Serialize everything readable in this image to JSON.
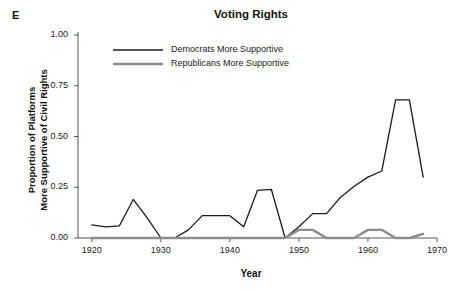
{
  "panel_label": "E",
  "axes": {
    "ylabel_line1": "Proportion of Platforms",
    "ylabel_line2": "More Supportive of Civil Rights",
    "xlabel": "Year"
  },
  "legend": {
    "items": [
      {
        "label": "Democrats More Supportive",
        "color": "#1a1a1a"
      },
      {
        "label": "Republicans More Supportive",
        "color": "#8c8c8c"
      }
    ]
  },
  "chart_data": {
    "type": "line",
    "title": "Voting Rights",
    "xlabel": "Year",
    "ylabel": "Proportion of Platforms More Supportive of Civil Rights",
    "xlim": [
      1918,
      1970
    ],
    "ylim": [
      0.0,
      1.0
    ],
    "grid": false,
    "legend_position": "top-left-inside",
    "xticks": [
      1920,
      1930,
      1940,
      1950,
      1960,
      1970
    ],
    "xtick_labels": [
      "1920",
      "1930",
      "1940",
      "1950",
      "1960",
      "1970"
    ],
    "yticks": [
      0.0,
      0.25,
      0.5,
      0.75,
      1.0
    ],
    "ytick_labels": [
      "0.00",
      "0.25",
      "0.50",
      "0.75",
      "1.00"
    ],
    "x": [
      1920,
      1922,
      1924,
      1926,
      1928,
      1930,
      1932,
      1934,
      1936,
      1938,
      1940,
      1942,
      1944,
      1946,
      1948,
      1950,
      1952,
      1954,
      1956,
      1958,
      1960,
      1962,
      1964,
      1966,
      1968
    ],
    "series": [
      {
        "name": "Democrats More Supportive",
        "color": "#1a1a1a",
        "values": [
          0.065,
          0.055,
          0.06,
          0.19,
          0.1,
          0.0,
          0.0,
          0.04,
          0.11,
          0.11,
          0.11,
          0.055,
          0.235,
          0.24,
          0.0,
          0.055,
          0.12,
          0.12,
          0.2,
          0.255,
          0.3,
          0.33,
          0.68,
          0.68,
          0.3
        ]
      },
      {
        "name": "Republicans More Supportive",
        "color": "#8c8c8c",
        "values": [
          0.0,
          0.0,
          0.0,
          0.0,
          0.0,
          0.0,
          0.0,
          0.0,
          0.0,
          0.0,
          0.0,
          0.0,
          0.0,
          0.0,
          0.0,
          0.04,
          0.04,
          0.0,
          0.0,
          0.0,
          0.04,
          0.04,
          0.0,
          0.0,
          0.02
        ]
      }
    ]
  }
}
